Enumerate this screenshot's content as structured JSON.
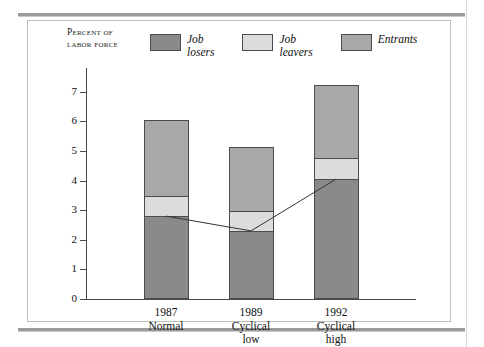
{
  "figure": {
    "axis_title_line1": "Percent of",
    "axis_title_line2": "labor force"
  },
  "legend": [
    {
      "name": "job-losers",
      "word1": "Job",
      "word2": "losers",
      "color": "#8a8a8a"
    },
    {
      "name": "job-leavers",
      "word1": "Job",
      "word2": "leavers",
      "color": "#dcdcdc"
    },
    {
      "name": "entrants",
      "word1": "Entrants",
      "word2": "",
      "color": "#a8a8a8"
    }
  ],
  "chart_data": {
    "type": "bar",
    "title": "",
    "xlabel": "",
    "ylabel": "Percent of labor force",
    "ylim": [
      0,
      7.6
    ],
    "yticks": [
      0,
      1,
      2,
      3,
      4,
      5,
      6,
      7
    ],
    "grid": false,
    "stacked": true,
    "legend_position": "top",
    "categories": [
      "1987",
      "1989",
      "1992"
    ],
    "category_sublabels": [
      "Normal",
      "Cyclical low",
      "Cyclical high"
    ],
    "series": [
      {
        "name": "Job losers",
        "values": [
          2.8,
          2.3,
          4.05
        ]
      },
      {
        "name": "Job leavers",
        "values": [
          0.7,
          0.7,
          0.75
        ]
      },
      {
        "name": "Entrants",
        "values": [
          2.6,
          2.2,
          2.5
        ]
      }
    ],
    "totals": [
      6.1,
      5.2,
      7.3
    ],
    "overlay_line": {
      "name": "Job losers level",
      "values": [
        2.8,
        2.3,
        4.05
      ]
    }
  }
}
